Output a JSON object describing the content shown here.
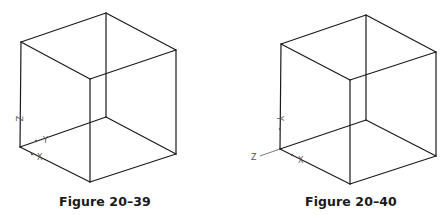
{
  "figures": [
    {
      "caption": "Figure 20–39",
      "view": "cube wireframe with UCS icon at bottom-left corner",
      "axis_labels": {
        "z": "Z",
        "y": "Y",
        "x": "X"
      },
      "vertices": {
        "top_left": [
          21,
          42
        ],
        "top_back": [
          106,
          13
        ],
        "top_right": [
          176,
          50
        ],
        "top_front": [
          90,
          79
        ],
        "bottom_left": [
          20,
          147
        ],
        "bottom_back": [
          106,
          117
        ],
        "bottom_right": [
          176,
          154
        ],
        "bottom_front": [
          90,
          182
        ]
      }
    },
    {
      "caption": "Figure 20–40",
      "view": "cube wireframe with UCS icon rotated (Z pointing left)",
      "axis_labels": {
        "z": "Z",
        "y": "Y",
        "x": "X"
      },
      "vertices": {
        "top_left": [
          281,
          44
        ],
        "top_back": [
          366,
          15
        ],
        "top_right": [
          436,
          52
        ],
        "top_front": [
          350,
          80
        ],
        "bottom_left": [
          280,
          149
        ],
        "bottom_back": [
          366,
          120
        ],
        "bottom_right": [
          436,
          156
        ],
        "bottom_front": [
          350,
          184
        ]
      }
    }
  ],
  "colors": {
    "line": "#1a1a1a",
    "axis": "#555555",
    "background": "#ffffff"
  }
}
